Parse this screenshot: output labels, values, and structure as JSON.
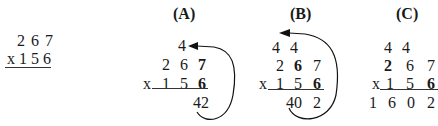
{
  "problem": {
    "top": "2 6 7",
    "bottom": "x 1 5 6"
  },
  "panels": [
    {
      "label": "(A)",
      "carry": [
        "4"
      ],
      "multiplicand": [
        "2",
        "6",
        "7"
      ],
      "multiplier": [
        "x",
        "1",
        "5",
        "6"
      ],
      "partial": "42"
    },
    {
      "label": "(B)",
      "carry": [
        "4",
        "4"
      ],
      "multiplicand": [
        "2",
        "6",
        "7"
      ],
      "multiplier": [
        "x",
        "1",
        "5",
        "6"
      ],
      "partial": [
        "40",
        "2"
      ]
    },
    {
      "label": "(C)",
      "carry": [
        "4",
        "4"
      ],
      "multiplicand": [
        "2",
        "6",
        "7"
      ],
      "multiplier": [
        "x",
        "1",
        "5",
        "6"
      ],
      "result": [
        "1",
        "6",
        "0",
        "2"
      ]
    }
  ]
}
